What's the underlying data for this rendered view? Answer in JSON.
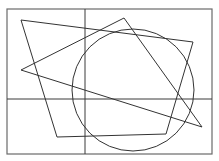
{
  "diagram": {
    "width": 219,
    "height": 161,
    "background": "#ffffff",
    "frame": {
      "x": 7,
      "y": 9,
      "width": 205,
      "height": 145,
      "color": "#6a6a6a",
      "stroke_width": 1.2
    },
    "axes": {
      "horizontal": {
        "x1": 7,
        "y1": 99,
        "x2": 212,
        "y2": 99
      },
      "vertical": {
        "x1": 85,
        "y1": 9,
        "x2": 85,
        "y2": 154
      },
      "color": "#3a3a3a",
      "stroke_width": 1
    },
    "quadrilateral": {
      "points": [
        [
          21,
          20
        ],
        [
          193,
          42
        ],
        [
          166,
          134
        ],
        [
          57,
          137
        ]
      ],
      "color": "#333333",
      "stroke_width": 1
    },
    "triangle": {
      "points": [
        [
          124,
          18
        ],
        [
          202,
          127
        ],
        [
          21,
          70
        ]
      ],
      "color": "#333333",
      "stroke_width": 1
    },
    "circle": {
      "cx": 133,
      "cy": 90,
      "r": 61,
      "color": "#333333",
      "stroke_width": 1
    }
  }
}
